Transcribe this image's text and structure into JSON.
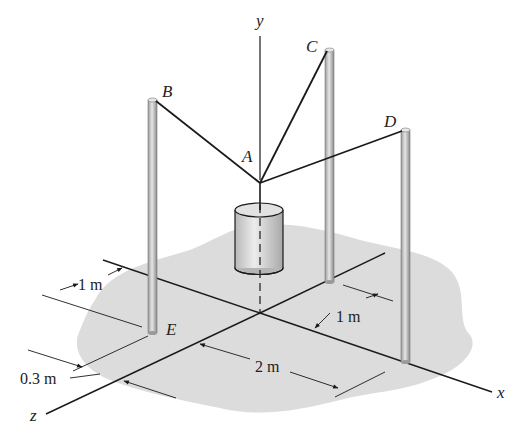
{
  "figure": {
    "axes": {
      "x": "x",
      "y": "y",
      "z": "z"
    },
    "points": {
      "A": "A",
      "B": "B",
      "C": "C",
      "D": "D",
      "E": "E"
    },
    "dimensions": {
      "e_from_x_axis": "1 m",
      "e_offset": "0.3 m",
      "origin_to_d_along_x": "2 m",
      "c_from_x_axis": "1 m"
    },
    "colors": {
      "ground": "#d9d9d9",
      "post": "#bdbdbd",
      "line": "#1a1a1a",
      "cylinder": "#cfcfcf"
    }
  }
}
